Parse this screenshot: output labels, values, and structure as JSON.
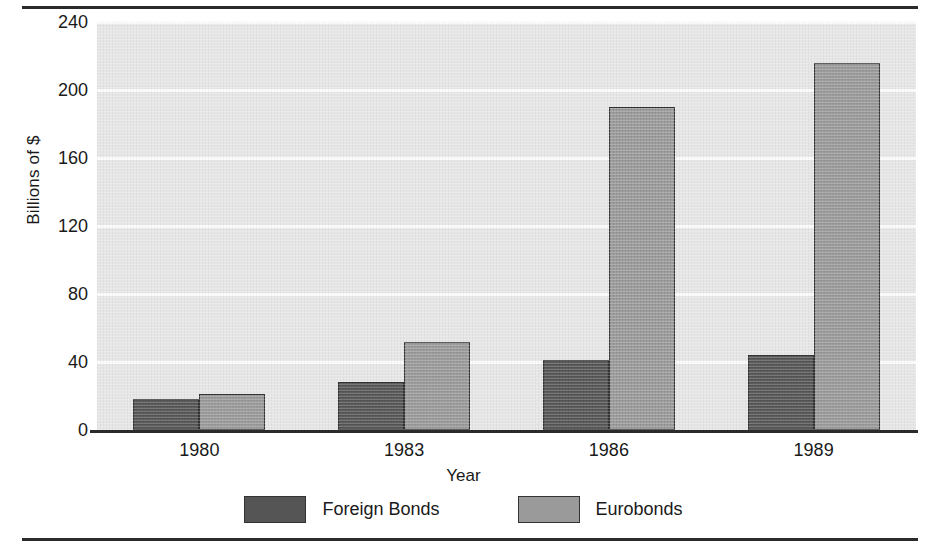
{
  "chart_data": {
    "type": "bar",
    "title": "",
    "xlabel": "Year",
    "ylabel": "Billions of $",
    "categories": [
      "1980",
      "1983",
      "1986",
      "1989"
    ],
    "series": [
      {
        "name": "Foreign Bonds",
        "color": "#555555",
        "values": [
          18,
          28,
          41,
          44
        ]
      },
      {
        "name": "Eurobonds",
        "color": "#9a9a9a",
        "values": [
          21,
          52,
          190,
          216
        ]
      }
    ],
    "ylim": [
      0,
      240
    ],
    "yticks": [
      0,
      40,
      80,
      120,
      160,
      200,
      240
    ],
    "ytick_labels": [
      "0",
      "40",
      "80",
      "120",
      "160",
      "200",
      "240"
    ],
    "grid": true,
    "grid_axis": "y",
    "legend_position": "bottom",
    "plot_background": "#e6e6e6",
    "gridline_color": "#fbfbfb",
    "axis_color": "#2b2b2b"
  }
}
